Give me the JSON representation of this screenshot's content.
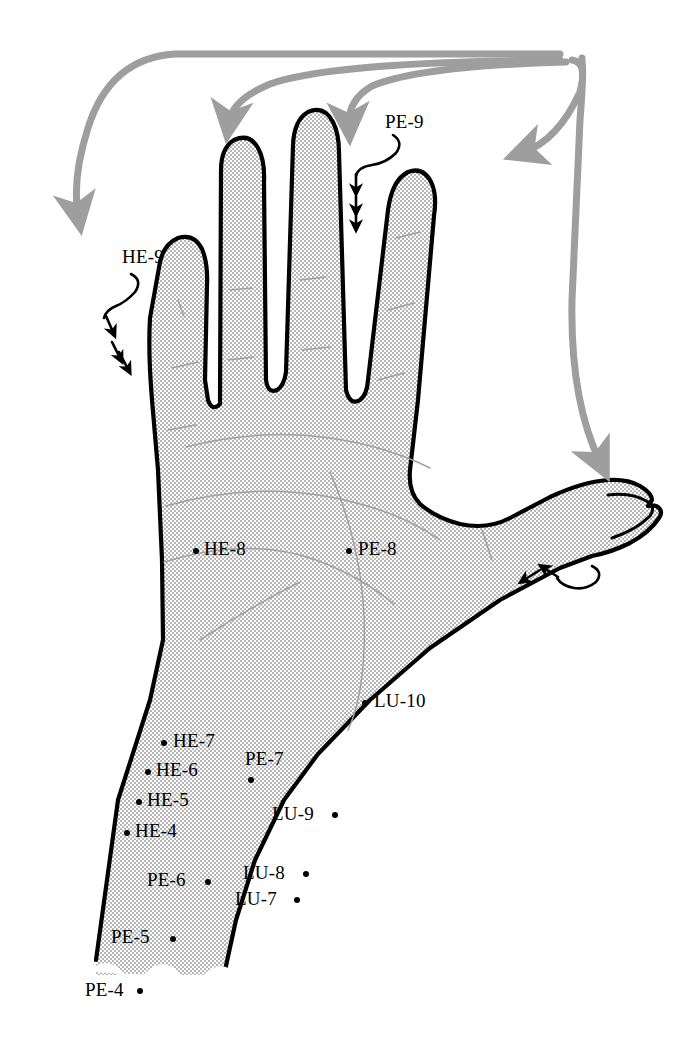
{
  "figure": {
    "width": 690,
    "height": 1037,
    "background_color": "#ffffff",
    "skin_fill_color": "#d9d9d9",
    "outline_color": "#000000",
    "crease_color": "#9a9a9a",
    "flow_arrow_color": "#9e9e9e",
    "marker_color": "#000000"
  },
  "points": [
    {
      "id": "HE-9",
      "label": "HE-9",
      "meridian": "Heart",
      "location": "little finger, radial nail corner",
      "label_x": 122,
      "label_y": 247,
      "dot": null
    },
    {
      "id": "PE-9",
      "label": "PE-9",
      "meridian": "Pericardium",
      "location": "middle finger tip",
      "label_x": 385,
      "label_y": 112,
      "dot": null
    },
    {
      "id": "HE-8",
      "label": "HE-8",
      "meridian": "Heart",
      "location": "palm, between 4th and 5th metacarpals",
      "label_x": 204,
      "label_y": 539,
      "dot": {
        "x": 193,
        "y": 548
      }
    },
    {
      "id": "PE-8",
      "label": "PE-8",
      "meridian": "Pericardium",
      "location": "centre of palm",
      "label_x": 358,
      "label_y": 539,
      "dot": {
        "x": 346,
        "y": 548
      }
    },
    {
      "id": "LU-10",
      "label": "LU-10",
      "meridian": "Lung",
      "location": "thenar eminence, midpoint of 1st metacarpal",
      "label_x": 374,
      "label_y": 691,
      "dot": {
        "x": 362,
        "y": 700
      }
    },
    {
      "id": "HE-7",
      "label": "HE-7",
      "meridian": "Heart",
      "location": "wrist crease, ulnar side",
      "label_x": 173,
      "label_y": 731,
      "dot": {
        "x": 161,
        "y": 740
      }
    },
    {
      "id": "HE-6",
      "label": "HE-6",
      "meridian": "Heart",
      "location": "0.5 cun above HE-7",
      "label_x": 156,
      "label_y": 760,
      "dot": {
        "x": 145,
        "y": 769
      }
    },
    {
      "id": "HE-5",
      "label": "HE-5",
      "meridian": "Heart",
      "location": "1 cun above HE-7",
      "label_x": 147,
      "label_y": 790,
      "dot": {
        "x": 136,
        "y": 799
      }
    },
    {
      "id": "HE-4",
      "label": "HE-4",
      "meridian": "Heart",
      "location": "1.5 cun above HE-7",
      "label_x": 135,
      "label_y": 821,
      "dot": {
        "x": 124,
        "y": 830
      }
    },
    {
      "id": "PE-7",
      "label": "PE-7",
      "meridian": "Pericardium",
      "location": "midpoint of wrist crease",
      "label_x": 245,
      "label_y": 749,
      "dot": {
        "x": 248,
        "y": 777
      }
    },
    {
      "id": "LU-9",
      "label": "LU-9",
      "meridian": "Lung",
      "location": "wrist crease, radial artery",
      "label_x": 272,
      "label_y": 804,
      "dot": {
        "x": 332,
        "y": 812
      }
    },
    {
      "id": "PE-6",
      "label": "PE-6",
      "meridian": "Pericardium",
      "location": "2 cun above wrist crease",
      "label_x": 147,
      "label_y": 870,
      "dot": {
        "x": 205,
        "y": 879
      }
    },
    {
      "id": "LU-8",
      "label": "LU-8",
      "meridian": "Lung",
      "location": "1 cun above LU-9",
      "label_x": 243,
      "label_y": 863,
      "dot": {
        "x": 303,
        "y": 871
      }
    },
    {
      "id": "LU-7",
      "label": "LU-7",
      "meridian": "Lung",
      "location": "1.5 cun above LU-9",
      "label_x": 235,
      "label_y": 889,
      "dot": {
        "x": 294,
        "y": 897
      }
    },
    {
      "id": "PE-5",
      "label": "PE-5",
      "meridian": "Pericardium",
      "location": "3 cun above wrist crease",
      "label_x": 111,
      "label_y": 927,
      "dot": {
        "x": 170,
        "y": 936
      }
    },
    {
      "id": "PE-4",
      "label": "PE-4",
      "meridian": "Pericardium",
      "location": "5 cun above wrist crease",
      "label_x": 85,
      "label_y": 980,
      "dot": {
        "x": 137,
        "y": 988
      }
    }
  ],
  "flow_arrows": {
    "description": "Grey meridian-flow arrows running from the proximal origin over the top of the hand and down onto the fingertips and thumb.",
    "targets": [
      "little finger",
      "ring finger",
      "middle finger",
      "index finger",
      "thumb"
    ],
    "count": 5
  },
  "needle_marks": {
    "description": "Black hooked insertion marks with directional arrowheads indicating needle direction.",
    "sites": [
      "little finger (HE-9)",
      "middle finger (PE-9)",
      "thumb (LU-11 region)"
    ]
  }
}
